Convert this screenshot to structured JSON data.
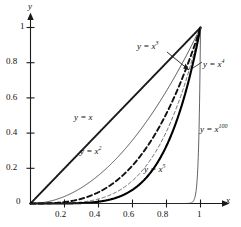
{
  "chart_data": {
    "type": "line",
    "title": "",
    "xlabel": "x",
    "ylabel": "y",
    "xlim": [
      0,
      1.12
    ],
    "ylim": [
      0,
      1.08
    ],
    "grid": false,
    "legend": "inline-annotations",
    "xticks": [
      "0.2",
      "0.4",
      "0.6",
      "0.8",
      "1"
    ],
    "xtick_values": [
      0.2,
      0.4,
      0.6,
      0.8,
      1
    ],
    "yticks": [
      "0",
      "0.2",
      "0.4",
      "0.6",
      "0.8",
      "1"
    ],
    "ytick_values": [
      0,
      0.2,
      0.4,
      0.6,
      0.8,
      1
    ],
    "origin_label": "0",
    "series": [
      {
        "name": "y = x",
        "exponent": 1,
        "style": "solid",
        "width": 1.9,
        "color": "#1a1a1a",
        "x": [
          0,
          0.1,
          0.2,
          0.3,
          0.4,
          0.5,
          0.6,
          0.7,
          0.8,
          0.9,
          1
        ],
        "values": [
          0,
          0.1,
          0.2,
          0.3,
          0.4,
          0.5,
          0.6,
          0.7,
          0.8,
          0.9,
          1
        ]
      },
      {
        "name": "y = x2",
        "exponent": 2,
        "style": "solid",
        "width": 0.9,
        "color": "#3a3a3a",
        "x": [
          0,
          0.1,
          0.2,
          0.3,
          0.4,
          0.5,
          0.6,
          0.7,
          0.8,
          0.9,
          1
        ],
        "values": [
          0,
          0.01,
          0.04,
          0.09,
          0.16,
          0.25,
          0.36,
          0.49,
          0.64,
          0.81,
          1
        ]
      },
      {
        "name": "y = x3",
        "exponent": 3,
        "style": "dashed",
        "width": 1.9,
        "color": "#111111",
        "x": [
          0,
          0.1,
          0.2,
          0.3,
          0.4,
          0.5,
          0.6,
          0.7,
          0.8,
          0.9,
          1
        ],
        "values": [
          0,
          0.001,
          0.008,
          0.027,
          0.064,
          0.125,
          0.216,
          0.343,
          0.512,
          0.729,
          1
        ]
      },
      {
        "name": "y = x4",
        "exponent": 4,
        "style": "dashed",
        "width": 0.9,
        "color": "#555555",
        "x": [
          0,
          0.1,
          0.2,
          0.3,
          0.4,
          0.5,
          0.6,
          0.7,
          0.8,
          0.9,
          1
        ],
        "values": [
          0,
          0.0001,
          0.0016,
          0.0081,
          0.0256,
          0.0625,
          0.1296,
          0.2401,
          0.4096,
          0.6561,
          1
        ]
      },
      {
        "name": "y = x5",
        "exponent": 5,
        "style": "solid",
        "width": 2.1,
        "color": "#000000",
        "x": [
          0,
          0.1,
          0.2,
          0.3,
          0.4,
          0.5,
          0.6,
          0.7,
          0.8,
          0.9,
          1
        ],
        "values": [
          0,
          1e-05,
          0.00032,
          0.00243,
          0.01024,
          0.03125,
          0.07776,
          0.16807,
          0.32768,
          0.59049,
          1
        ]
      },
      {
        "name": "y = x100",
        "exponent": 100,
        "style": "solid",
        "width": 0.8,
        "color": "#3a3a3a",
        "x": [
          0,
          0.5,
          0.8,
          0.9,
          0.95,
          0.97,
          0.98,
          0.99,
          1
        ],
        "values": [
          0,
          0,
          0,
          2.66e-05,
          0.0059,
          0.0476,
          0.1326,
          0.366,
          1
        ]
      }
    ],
    "annotations": [
      {
        "text_prefix": "y = x",
        "exponent": "",
        "name": "label-y-eq-x"
      },
      {
        "text_prefix": "y = x",
        "exponent": "2",
        "name": "label-y-eq-x2"
      },
      {
        "text_prefix": "y = x",
        "exponent": "3",
        "name": "label-y-eq-x3"
      },
      {
        "text_prefix": "y = x",
        "exponent": "4",
        "name": "label-y-eq-x4"
      },
      {
        "text_prefix": "y = x",
        "exponent": "5",
        "name": "label-y-eq-x5"
      },
      {
        "text_prefix": "y = x",
        "exponent": "100",
        "name": "label-y-eq-x100"
      }
    ]
  },
  "axes": {
    "x_axis_label": "x",
    "y_axis_label": "y",
    "origin": "0",
    "x_tick_labels": [
      "0.2",
      "0.4",
      "0.6",
      "0.8",
      "1"
    ],
    "y_tick_labels": [
      "0.2",
      "0.4",
      "0.6",
      "0.8",
      "1"
    ]
  },
  "labels": {
    "y_eq_x": "y = x",
    "y_eq_x2_base": "y = x",
    "y_eq_x2_sup": "2",
    "y_eq_x3_base": "y = x",
    "y_eq_x3_sup": "3",
    "y_eq_x4_base": "y = x",
    "y_eq_x4_sup": "4",
    "y_eq_x5_base": "y = x",
    "y_eq_x5_sup": "5",
    "y_eq_x100_base": "y = x",
    "y_eq_x100_sup": "100"
  },
  "colors": {
    "axis": "#1a1a1a",
    "curve_dark": "#000000",
    "curve_mid": "#3a3a3a",
    "curve_light": "#555555",
    "background": "#ffffff"
  }
}
